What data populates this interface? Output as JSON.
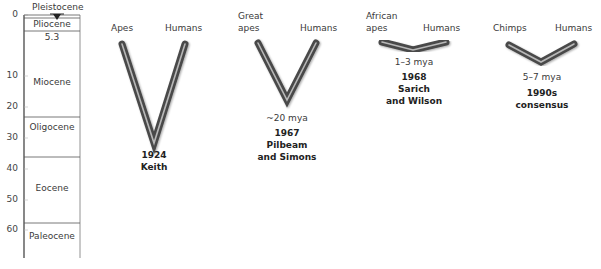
{
  "timeline": {
    "top_label": "Pleistocene",
    "ticks": [
      "0",
      "10",
      "20",
      "30",
      "40",
      "50",
      "60"
    ],
    "epochs": [
      {
        "name": "Pliocene",
        "start_mya": 0,
        "end_mya": 5.3
      },
      {
        "name": "Miocene",
        "start_mya": 5.3,
        "end_mya": 23
      },
      {
        "name": "Oligocene",
        "start_mya": 23,
        "end_mya": 34
      },
      {
        "name": "Eocene",
        "start_mya": 34,
        "end_mya": 56
      },
      {
        "name": "Paleocene",
        "start_mya": 56,
        "end_mya": 66
      }
    ],
    "boundary_label": "5.3"
  },
  "trees": [
    {
      "left_label": "Apes",
      "right_label": "Humans",
      "divergence": "",
      "year": "1924",
      "author_line1": "Keith",
      "author_line2": ""
    },
    {
      "left_label_line1": "Great",
      "left_label_line2": "apes",
      "right_label": "Humans",
      "divergence": "~20 mya",
      "year": "1967",
      "author_line1": "Pilbeam",
      "author_line2": "and Simons"
    },
    {
      "left_label_line1": "African",
      "left_label_line2": "apes",
      "right_label": "Humans",
      "divergence": "1–3 mya",
      "year": "1968",
      "author_line1": "Sarich",
      "author_line2": "and Wilson"
    },
    {
      "left_label": "Chimps",
      "right_label": "Humans",
      "divergence": "5–7 mya",
      "year": "1990s",
      "author_line1": "consensus",
      "author_line2": ""
    }
  ],
  "colors": {
    "branch_outer": "#4a4a4a",
    "branch_inner": "#b8b8b8",
    "axis": "#555555"
  }
}
